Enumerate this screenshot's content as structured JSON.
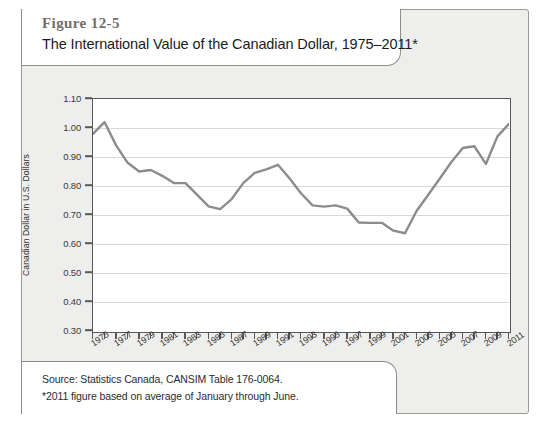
{
  "figure": {
    "number": "Figure 12-5",
    "title": "The International Value of the Canadian Dollar, 1975–2011*",
    "source": "Source: Statistics Canada, CANSIM Table 176-0064.",
    "note": "*2011 figure based on average of January through June."
  },
  "chart_data": {
    "type": "line",
    "title": "The International Value of the Canadian Dollar, 1975–2011*",
    "xlabel": "",
    "ylabel": "Canadian Dollar in U.S. Dollars",
    "ylim": [
      0.3,
      1.1
    ],
    "xlim": [
      1975,
      2011
    ],
    "ytick_labels": [
      "1.10",
      "1.00",
      "0.90",
      "0.80",
      "0.70",
      "0.60",
      "0.50",
      "0.40",
      "0.30"
    ],
    "ytick_values": [
      1.1,
      1.0,
      0.9,
      0.8,
      0.7,
      0.6,
      0.5,
      0.4,
      0.3
    ],
    "xtick_labels": [
      "1975",
      "1977",
      "1979",
      "1981",
      "1983",
      "1985",
      "1987",
      "1989",
      "1991",
      "1993",
      "1995",
      "1997",
      "1999",
      "2001",
      "2003",
      "2005",
      "2007",
      "2009",
      "2011"
    ],
    "xtick_step": 2,
    "minor_xtick_step": 1,
    "grid": true,
    "legend": null,
    "line_color": "#8c8c8c",
    "x": [
      1975,
      1976,
      1977,
      1978,
      1979,
      1980,
      1981,
      1982,
      1983,
      1984,
      1985,
      1986,
      1987,
      1988,
      1989,
      1990,
      1991,
      1992,
      1993,
      1994,
      1995,
      1996,
      1997,
      1998,
      1999,
      2000,
      2001,
      2002,
      2003,
      2004,
      2005,
      2006,
      2007,
      2008,
      2009,
      2010,
      2011
    ],
    "values": [
      0.98,
      1.02,
      0.94,
      0.88,
      0.85,
      0.855,
      0.835,
      0.81,
      0.81,
      0.77,
      0.73,
      0.72,
      0.755,
      0.81,
      0.845,
      0.857,
      0.873,
      0.827,
      0.775,
      0.733,
      0.729,
      0.733,
      0.722,
      0.674,
      0.673,
      0.673,
      0.646,
      0.637,
      0.714,
      0.769,
      0.825,
      0.882,
      0.931,
      0.937,
      0.876,
      0.971,
      1.014
    ]
  }
}
